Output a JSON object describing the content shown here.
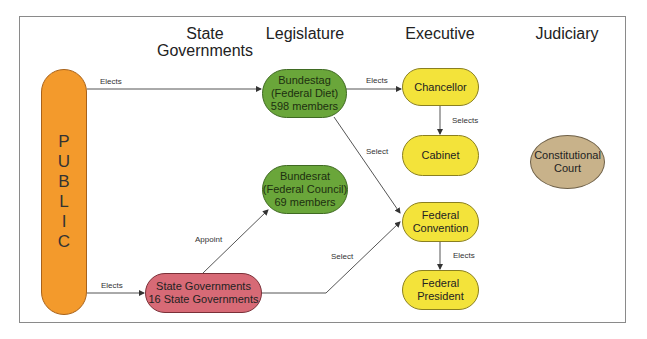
{
  "columns": {
    "state": "State Governments",
    "state_line1": "State",
    "state_line2": "Governments",
    "legislature": "Legislature",
    "executive": "Executive",
    "judiciary": "Judiciary"
  },
  "nodes": {
    "public": {
      "letters": [
        "P",
        "U",
        "B",
        "L",
        "I",
        "C"
      ],
      "color": "#f39a2c"
    },
    "bundestag": {
      "lines": [
        "Bundestag",
        "(Federal Diet)",
        "598 members"
      ],
      "color": "#6aa63a"
    },
    "bundesrat": {
      "lines": [
        "Bundesrat",
        "(Federal Council)",
        "69 members"
      ],
      "color": "#6aa63a"
    },
    "state_governments": {
      "lines": [
        "State Governments",
        "16 State Governments"
      ],
      "color": "#d76a76"
    },
    "chancellor": {
      "label": "Chancellor",
      "color": "#f3e33a"
    },
    "cabinet": {
      "label": "Cabinet",
      "color": "#f3e33a"
    },
    "federal_convention": {
      "lines": [
        "Federal",
        "Convention"
      ],
      "color": "#f3e33a"
    },
    "federal_president": {
      "lines": [
        "Federal",
        "President"
      ],
      "color": "#f3e33a"
    },
    "constitutional_court": {
      "lines": [
        "Constitutional",
        "Court"
      ],
      "color": "#c8b28a"
    }
  },
  "edges": {
    "public_bundestag": "Elects",
    "public_state": "Elects",
    "bundestag_chancellor": "Elects",
    "chancellor_cabinet": "Selects",
    "bundestag_convention": "Select",
    "state_bundesrat": "Appoint",
    "state_convention": "Select",
    "convention_president": "Elects"
  }
}
